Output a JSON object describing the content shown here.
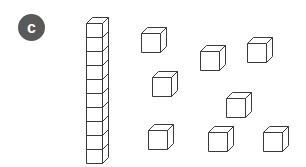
{
  "figure": {
    "background_color": "#ffffff",
    "line_color": "#3a3a3a",
    "face_color": "#ffffff",
    "width": 306,
    "height": 167
  },
  "label": {
    "text": "c",
    "shape": "filled-circle",
    "background_color": "#595959",
    "text_color": "#ffffff",
    "x": 18,
    "y": 14,
    "size": 27
  },
  "rod": {
    "name": "ten-rod",
    "segments": 10,
    "value": 10,
    "orientation": "vertical",
    "x": 86,
    "y": 17,
    "cell_width": 16,
    "cell_height": 14,
    "depth": 6
  },
  "unit_cubes": {
    "count": 8,
    "value_each": 1,
    "size": 19,
    "depth": 6,
    "items": [
      {
        "id": "cube-1",
        "x": 141,
        "y": 27
      },
      {
        "id": "cube-2",
        "x": 200,
        "y": 45
      },
      {
        "id": "cube-3",
        "x": 247,
        "y": 37
      },
      {
        "id": "cube-4",
        "x": 152,
        "y": 71
      },
      {
        "id": "cube-5",
        "x": 226,
        "y": 92
      },
      {
        "id": "cube-6",
        "x": 148,
        "y": 124
      },
      {
        "id": "cube-7",
        "x": 208,
        "y": 126
      },
      {
        "id": "cube-8",
        "x": 263,
        "y": 126
      }
    ]
  },
  "total": {
    "tens": 1,
    "ones": 8,
    "value": 18
  },
  "chart_data": {
    "type": "table",
    "categories": [
      "tens (rods)",
      "ones (unit cubes)"
    ],
    "values": [
      1,
      8
    ],
    "annotations": [
      "rod has 10 stacked unit segments",
      "8 loose unit cubes",
      "represents 18"
    ],
    "xlabel": "place value",
    "ylabel": "count",
    "grid": false,
    "legend": "none"
  }
}
